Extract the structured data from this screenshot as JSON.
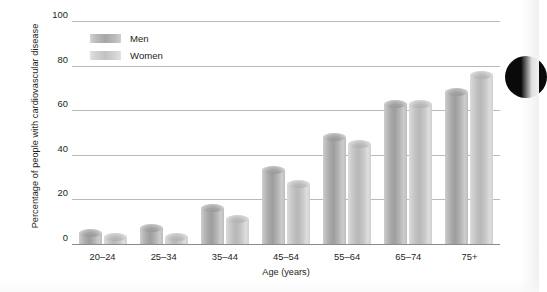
{
  "chart_data": {
    "type": "bar",
    "title": "",
    "xlabel": "Age (years)",
    "ylabel": "Percentage of people with cardiovascular disease",
    "categories": [
      "20–24",
      "25–34",
      "35–44",
      "45–54",
      "55–64",
      "65–74",
      "75+"
    ],
    "series": [
      {
        "name": "Men",
        "values": [
          5,
          7,
          16,
          33,
          48,
          63,
          68
        ],
        "color": "#a6a6a6"
      },
      {
        "name": "Women",
        "values": [
          3,
          3,
          11,
          27,
          45,
          63,
          76
        ],
        "color": "#c6c6c6"
      }
    ],
    "ylim": [
      0,
      100
    ],
    "yticks": [
      0,
      20,
      40,
      60,
      80,
      100
    ],
    "ytick_labels": [
      "0",
      "20",
      "40",
      "60",
      "80",
      "100"
    ],
    "grid": true,
    "legend_position": "top-left",
    "legend_entries": [
      "Men",
      "Women"
    ]
  },
  "marker": {
    "page_bullet_label": "page-bullet"
  }
}
